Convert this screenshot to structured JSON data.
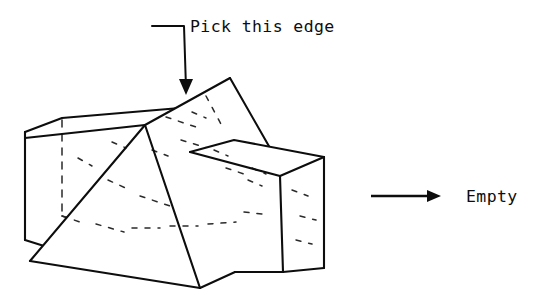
{
  "figure": {
    "type": "solid-model-boolean-diagram",
    "background_color": "#ffffff",
    "line_color": "#0d0d0d",
    "hidden_line_color": "#2a2a2a",
    "callout": {
      "label": "Pick this edge",
      "label_x": 190,
      "label_y": 32,
      "leader_start_x": 152,
      "leader_start_y": 26,
      "leader_elbow_x": 184,
      "leader_elbow_y": 26,
      "arrow_tip_x": 186,
      "arrow_tip_y": 95
    },
    "result": {
      "label": "Empty",
      "label_x": 466,
      "label_y": 202,
      "arrow_start_x": 371,
      "arrow_start_y": 196,
      "arrow_end_x": 438,
      "arrow_end_y": 196
    },
    "shapes": [
      {
        "name": "left-box",
        "kind": "rectangular-box",
        "description": "Left rectangular block, partially hidden behind the central wedge"
      },
      {
        "name": "right-box",
        "kind": "rectangular-box",
        "description": "Right rectangular block, front face visible, pierced by the wedge"
      },
      {
        "name": "center-wedge",
        "kind": "triangular-prism",
        "description": "Central triangular wedge/prism intersecting both boxes, apex at top"
      }
    ],
    "geometry": {
      "left_box": {
        "top_back_left": [
          25,
          132
        ],
        "top_back_right": [
          62,
          118
        ],
        "top_front_left": [
          25,
          138
        ],
        "bottom_front_left": [
          25,
          240
        ],
        "hidden_vertical": [
          [
            62,
            120
          ],
          [
            62,
            216
          ]
        ],
        "top_front_edge": [
          [
            25,
            138
          ],
          [
            145,
            125
          ]
        ]
      },
      "right_box": {
        "top_far_right": [
          323,
          157
        ],
        "bottom_far_right": [
          324,
          268
        ],
        "front_top_left": [
          283,
          175
        ],
        "back_top_left": [
          200,
          150
        ],
        "front_bottom": [
          283,
          272
        ]
      },
      "wedge": {
        "apex": [
          230,
          78
        ],
        "ridge_left": [
          145,
          125
        ],
        "right_slope_end": [
          270,
          148
        ],
        "bottom_left": [
          30,
          261
        ],
        "bottom_front_right": [
          200,
          288
        ],
        "bottom_right": [
          235,
          272
        ]
      }
    }
  }
}
